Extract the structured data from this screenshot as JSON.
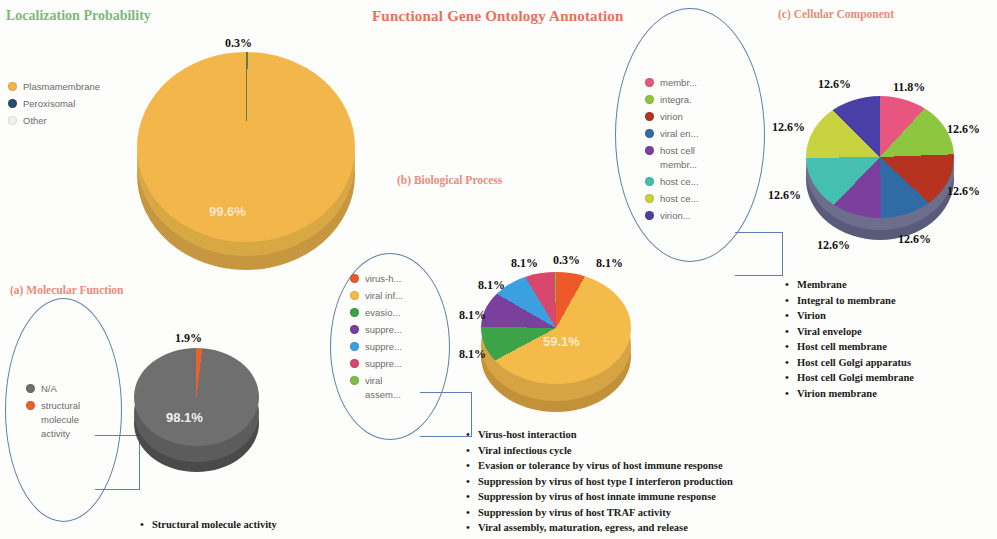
{
  "figure": {
    "main_title": "Functional Gene Ontology Annotation",
    "localization_title": "Localization Probability",
    "panel_a_title": "(a) Molecular Function",
    "panel_b_title": "(b) Biological Process",
    "panel_c_title": "(c) Cellular Component"
  },
  "localization": {
    "legend": [
      {
        "label": "Plasmamembrane",
        "color": "#f3b64a"
      },
      {
        "label": "Peroxisomal",
        "color": "#2b4c6f"
      },
      {
        "label": "Other",
        "color": "#f2f2f2"
      }
    ]
  },
  "molecular_function": {
    "legend": [
      {
        "label": "N/A",
        "color": "#6f6f6f"
      },
      {
        "label": "structural\nmolecule\nactivity",
        "color": "#e8622c"
      }
    ],
    "bullets": [
      "Structural molecule activity"
    ]
  },
  "biological_process": {
    "legend": [
      {
        "label": "virus-h...",
        "color": "#ec5a2a"
      },
      {
        "label": "viral inf...",
        "color": "#f4bb4a"
      },
      {
        "label": "evasio...",
        "color": "#3da34a"
      },
      {
        "label": "suppre...",
        "color": "#7b3f9e"
      },
      {
        "label": "suppre...",
        "color": "#3aa0e0"
      },
      {
        "label": "suppre...",
        "color": "#d9476f"
      },
      {
        "label": "viral\nassem...",
        "color": "#7bc043"
      }
    ],
    "bullets": [
      "Virus-host interaction",
      "Viral infectious cycle",
      "Evasion or tolerance by virus of host immune response",
      "Suppression by virus of host type I interferon production",
      "Suppression by virus of host innate immune response",
      "Suppression by virus of host TRAF activity",
      "Viral assembly, maturation, egress, and release"
    ]
  },
  "cellular_component": {
    "legend": [
      {
        "label": "membr...",
        "color": "#e8557f"
      },
      {
        "label": "integra.",
        "color": "#8dc63f"
      },
      {
        "label": "virion",
        "color": "#b5331f"
      },
      {
        "label": "viral en...",
        "color": "#2f6ca6"
      },
      {
        "label": "host cell\nmembr...",
        "color": "#7b3f9e"
      },
      {
        "label": "host ce...",
        "color": "#45bfb0"
      },
      {
        "label": "host ce...",
        "color": "#c9d23f"
      },
      {
        "label": "virion...",
        "color": "#4a3fa6"
      }
    ],
    "bullets": [
      "Membrane",
      "Integral to membrane",
      "Virion",
      "Viral envelope",
      "Host cell membrane",
      "Host cell Golgi apparatus",
      "Host cell Golgi membrane",
      "Virion membrane"
    ]
  },
  "chart_data": [
    {
      "type": "pie",
      "title": "Localization Probability",
      "categories": [
        "Plasmamembrane",
        "Peroxisomal",
        "Other"
      ],
      "values": [
        99.6,
        0.3,
        0.1
      ],
      "labels": [
        "99.6%",
        "0.3%"
      ],
      "colors": [
        "#f3b64a",
        "#2b4c6f",
        "#f2f2f2"
      ],
      "legend_position": "left"
    },
    {
      "type": "pie",
      "title": "(a) Molecular Function",
      "categories": [
        "N/A",
        "structural molecule activity"
      ],
      "values": [
        98.1,
        1.9
      ],
      "labels": [
        "98.1%",
        "1.9%"
      ],
      "colors": [
        "#6f6f6f",
        "#e8622c"
      ],
      "legend_position": "left"
    },
    {
      "type": "pie",
      "title": "(b) Biological Process",
      "categories": [
        "Virus-host interaction",
        "Viral infectious cycle",
        "Evasion or tolerance by virus of host immune response",
        "Suppression by virus of host type I interferon production",
        "Suppression by virus of host innate immune response",
        "Suppression by virus of host TRAF activity",
        "Viral assembly, maturation, egress, and release"
      ],
      "values": [
        8.1,
        59.1,
        8.1,
        8.1,
        8.1,
        8.1,
        0.3
      ],
      "labels": [
        "8.1%",
        "59.1%",
        "8.1%",
        "8.1%",
        "8.1%",
        "8.1%",
        "0.3%"
      ],
      "colors": [
        "#ec5a2a",
        "#f4bb4a",
        "#3da34a",
        "#7b3f9e",
        "#3aa0e0",
        "#d9476f",
        "#7bc043"
      ],
      "legend_position": "left"
    },
    {
      "type": "pie",
      "title": "(c) Cellular Component",
      "categories": [
        "Membrane",
        "Integral to membrane",
        "Virion",
        "Viral envelope",
        "Host cell membrane",
        "Host cell Golgi apparatus",
        "Host cell Golgi membrane",
        "Virion membrane"
      ],
      "values": [
        11.8,
        12.6,
        12.6,
        12.6,
        12.6,
        12.6,
        12.6,
        12.6
      ],
      "labels": [
        "11.8%",
        "12.6%",
        "12.6%",
        "12.6%",
        "12.6%",
        "12.6%",
        "12.6%",
        "12.6%"
      ],
      "colors": [
        "#e8557f",
        "#8dc63f",
        "#b5331f",
        "#2f6ca6",
        "#7b3f9e",
        "#45bfb0",
        "#c9d23f",
        "#4a3fa6"
      ],
      "legend_position": "left"
    }
  ]
}
